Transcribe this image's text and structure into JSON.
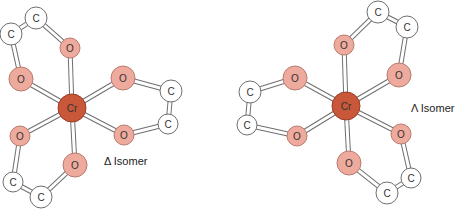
{
  "colors": {
    "cr_fill": "#c9573a",
    "cr_stroke": "#9a3d25",
    "o_fill": "#eeaa9d",
    "o_stroke": "#b97b70",
    "c_fill": "#ffffff",
    "c_stroke": "#6f6f6f",
    "bond_stroke": "#6f6f6f",
    "bond_fill": "#ffffff"
  },
  "isomers": [
    {
      "id": "delta",
      "label": "Δ Isomer",
      "label_pos": [
        104,
        155
      ],
      "atoms": [
        {
          "el": "Cr",
          "label": "Cr",
          "x": 72,
          "y": 108,
          "r": 14
        },
        {
          "el": "O",
          "label": "O",
          "x": 70,
          "y": 48,
          "r": 10
        },
        {
          "el": "O",
          "label": "O",
          "x": 21,
          "y": 79,
          "r": 12
        },
        {
          "el": "O",
          "label": "O",
          "x": 123,
          "y": 78,
          "r": 12
        },
        {
          "el": "O",
          "label": "O",
          "x": 20,
          "y": 136,
          "r": 10
        },
        {
          "el": "O",
          "label": "O",
          "x": 124,
          "y": 135,
          "r": 10
        },
        {
          "el": "O",
          "label": "O",
          "x": 75,
          "y": 165,
          "r": 12
        },
        {
          "el": "C",
          "label": "C",
          "x": 11,
          "y": 34,
          "r": 11
        },
        {
          "el": "C",
          "label": "C",
          "x": 36,
          "y": 18,
          "r": 11
        },
        {
          "el": "C",
          "label": "C",
          "x": 171,
          "y": 91,
          "r": 11
        },
        {
          "el": "C",
          "label": "C",
          "x": 168,
          "y": 124,
          "r": 10
        },
        {
          "el": "C",
          "label": "C",
          "x": 13,
          "y": 182,
          "r": 10
        },
        {
          "el": "C",
          "label": "C",
          "x": 41,
          "y": 197,
          "r": 11
        }
      ],
      "bonds": [
        [
          0,
          1
        ],
        [
          0,
          2
        ],
        [
          0,
          3
        ],
        [
          0,
          4
        ],
        [
          0,
          5
        ],
        [
          0,
          6
        ],
        [
          2,
          7
        ],
        [
          7,
          8
        ],
        [
          8,
          1
        ],
        [
          3,
          9
        ],
        [
          9,
          10
        ],
        [
          10,
          5
        ],
        [
          4,
          11
        ],
        [
          11,
          12
        ],
        [
          12,
          6
        ]
      ]
    },
    {
      "id": "lambda",
      "label": "Λ Isomer",
      "label_pos": [
        411,
        102
      ],
      "atoms": [
        {
          "el": "Cr",
          "label": "Cr",
          "x": 346,
          "y": 106,
          "r": 14
        },
        {
          "el": "O",
          "label": "O",
          "x": 344,
          "y": 45,
          "r": 10
        },
        {
          "el": "O",
          "label": "O",
          "x": 295,
          "y": 78,
          "r": 12
        },
        {
          "el": "O",
          "label": "O",
          "x": 399,
          "y": 75,
          "r": 12
        },
        {
          "el": "O",
          "label": "O",
          "x": 297,
          "y": 136,
          "r": 10
        },
        {
          "el": "O",
          "label": "O",
          "x": 401,
          "y": 134,
          "r": 10
        },
        {
          "el": "O",
          "label": "O",
          "x": 349,
          "y": 163,
          "r": 12
        },
        {
          "el": "C",
          "label": "C",
          "x": 378,
          "y": 12,
          "r": 11
        },
        {
          "el": "C",
          "label": "C",
          "x": 407,
          "y": 27,
          "r": 11
        },
        {
          "el": "C",
          "label": "C",
          "x": 250,
          "y": 92,
          "r": 11
        },
        {
          "el": "C",
          "label": "C",
          "x": 247,
          "y": 125,
          "r": 10
        },
        {
          "el": "C",
          "label": "C",
          "x": 411,
          "y": 178,
          "r": 10
        },
        {
          "el": "C",
          "label": "C",
          "x": 387,
          "y": 193,
          "r": 11
        }
      ],
      "bonds": [
        [
          0,
          1
        ],
        [
          0,
          2
        ],
        [
          0,
          3
        ],
        [
          0,
          4
        ],
        [
          0,
          5
        ],
        [
          0,
          6
        ],
        [
          1,
          7
        ],
        [
          7,
          8
        ],
        [
          8,
          3
        ],
        [
          2,
          9
        ],
        [
          9,
          10
        ],
        [
          10,
          4
        ],
        [
          5,
          11
        ],
        [
          11,
          12
        ],
        [
          12,
          6
        ]
      ]
    }
  ]
}
